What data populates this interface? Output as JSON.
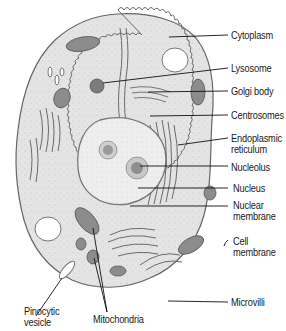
{
  "diagram": {
    "colors": {
      "cytoplasm_fill": "#e6e6e6",
      "outline": "#555555",
      "nucleus_fill": "#eeeeee",
      "organelle_fill": "#8a8a8a",
      "leader_line": "#111111",
      "label_text": "#1a1a1a"
    },
    "labels": [
      {
        "id": "cytoplasm",
        "text": "Cytoplasm"
      },
      {
        "id": "lysosome",
        "text": "Lysosome"
      },
      {
        "id": "golgi-body",
        "text": "Golgi body"
      },
      {
        "id": "centrosomes",
        "text": "Centrosomes"
      },
      {
        "id": "endoplasmic-reticulum",
        "text": "Endoplasmic\nreticulum"
      },
      {
        "id": "nucleolus",
        "text": "Nucleolus"
      },
      {
        "id": "nucleus",
        "text": "Nucleus"
      },
      {
        "id": "nuclear-membrane",
        "text": "Nuclear\nmembrane"
      },
      {
        "id": "cell-membrane",
        "text": "Cell\nmembrane"
      },
      {
        "id": "microvilli",
        "text": "Microvilli"
      },
      {
        "id": "pinocytic-vesicle",
        "text": "Pinocytic\nvesicle"
      },
      {
        "id": "mitochondria",
        "text": "Mitochondria"
      }
    ]
  }
}
